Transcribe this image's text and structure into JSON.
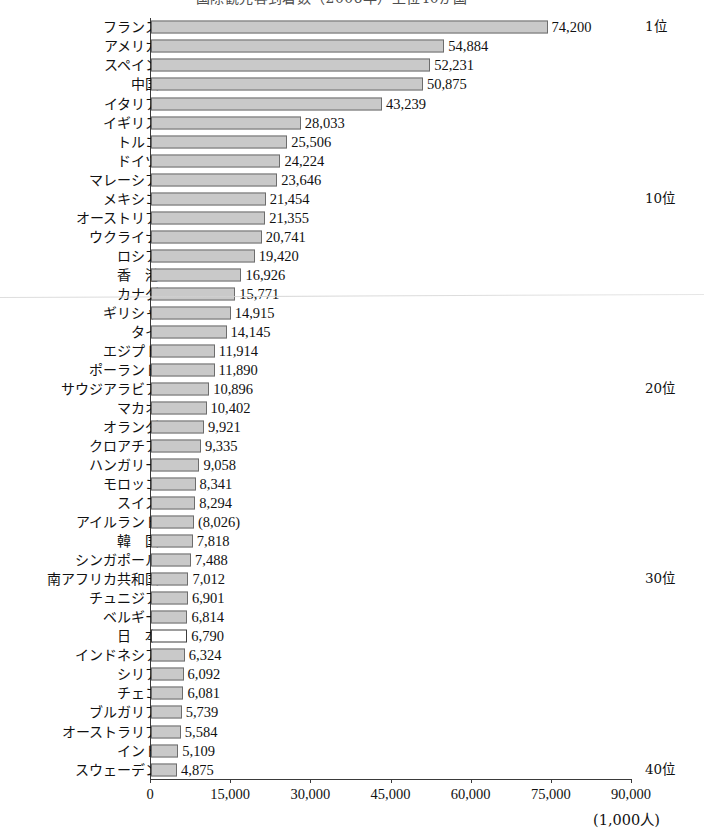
{
  "title": {
    "text": "国際観光客到着数（2006年）上位40か国",
    "cropped": true
  },
  "axis": {
    "unit_label": "(1,000人)",
    "x_ticks": [
      "0",
      "15,000",
      "30,000",
      "45,000",
      "60,000",
      "75,000",
      "90,000"
    ],
    "x_tick_values": [
      0,
      15000,
      30000,
      45000,
      60000,
      75000,
      90000
    ],
    "x_min": 0,
    "x_max": 90000
  },
  "rank_markers": [
    {
      "row": 0,
      "label": "1位"
    },
    {
      "row": 9,
      "label": "10位"
    },
    {
      "row": 19,
      "label": "20位"
    },
    {
      "row": 29,
      "label": "30位"
    },
    {
      "row": 39,
      "label": "40位"
    }
  ],
  "colors": {
    "bar_fill": "#c9c9c9",
    "bar_border": "#6d6d6d",
    "highlight_fill": "#ffffff",
    "highlight_border": "#3d3d3d",
    "axis": "#3a3a3a",
    "text": "#111111"
  },
  "chart_data": {
    "type": "bar",
    "orientation": "horizontal",
    "title": "国際観光客到着数（2006年）上位40か国",
    "xlabel": "(1,000人)",
    "ylabel": "",
    "xlim": [
      0,
      90000
    ],
    "grid": false,
    "legend": false,
    "categories": [
      "フランス",
      "アメリカ",
      "スペイン",
      "中国",
      "イタリア",
      "イギリス",
      "トルコ",
      "ドイツ",
      "マレーシア",
      "メキシコ",
      "オーストリア",
      "ウクライナ",
      "ロシア",
      "香　港",
      "カナダ",
      "ギリシャ",
      "タイ",
      "エジプト",
      "ポーランド",
      "サウジアラビア",
      "マカオ",
      "オランダ",
      "クロアチア",
      "ハンガリー",
      "モロッコ",
      "スイス",
      "アイルランド",
      "韓　国",
      "シンガポール",
      "南アフリカ共和国",
      "チュニジア",
      "ベルギー",
      "日　本",
      "インドネシア",
      "シリア",
      "チェコ",
      "ブルガリア",
      "オーストラリア",
      "インド",
      "スウェーデン"
    ],
    "values": [
      74200,
      54884,
      52231,
      50875,
      43239,
      28033,
      25506,
      24224,
      23646,
      21454,
      21355,
      20741,
      19420,
      16926,
      15771,
      14915,
      14145,
      11914,
      11890,
      10896,
      10402,
      9921,
      9335,
      9058,
      8341,
      8294,
      8026,
      7818,
      7488,
      7012,
      6901,
      6814,
      6790,
      6324,
      6092,
      6081,
      5739,
      5584,
      5109,
      4875
    ],
    "value_labels": [
      "74,200",
      "54,884",
      "52,231",
      "50,875",
      "43,239",
      "28,033",
      "25,506",
      "24,224",
      "23,646",
      "21,454",
      "21,355",
      "20,741",
      "19,420",
      "16,926",
      "15,771",
      "14,915",
      "14,145",
      "11,914",
      "11,890",
      "10,896",
      "10,402",
      "9,921",
      "9,335",
      "9,058",
      "8,341",
      "8,294",
      "(8,026)",
      "7,818",
      "7,488",
      "7,012",
      "6,901",
      "6,814",
      "6,790",
      "6,324",
      "6,092",
      "6,081",
      "5,739",
      "5,584",
      "5,109",
      "4,875"
    ],
    "highlight_index": 32,
    "highlight_note": "日本 is drawn as an unfilled (white) bar"
  }
}
